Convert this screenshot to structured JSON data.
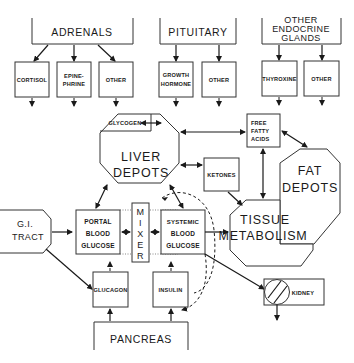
{
  "diagram": {
    "glands": {
      "adrenals": "ADRENALS",
      "pituitary": "PITUITARY",
      "other_endocrine_1": "OTHER",
      "other_endocrine_2": "ENDOCRINE",
      "other_endocrine_3": "GLANDS",
      "pancreas": "PANCREAS"
    },
    "hormones": {
      "cortisol": "CORTISOL",
      "epinephrine_1": "EPINE-",
      "epinephrine_2": "PHRINE",
      "adrenal_other": "OTHER",
      "growth_1": "GROWTH",
      "growth_2": "HORMONE",
      "pituitary_other": "OTHER",
      "thyroxine": "THYROXINE",
      "endocrine_other": "OTHER",
      "glucagon": "GLUCAGON",
      "insulin": "INSULIN"
    },
    "stores": {
      "glycogen": "GLYCOGEN",
      "liver_1": "LIVER",
      "liver_2": "DEPOTS",
      "ffa_1": "FREE",
      "ffa_2": "FATTY",
      "ffa_3": "ACIDS",
      "ketones": "KETONES",
      "fat_1": "FAT",
      "fat_2": "DEPOTS"
    },
    "flow": {
      "gi_1": "G.I.",
      "gi_2": "TRACT",
      "portal_1": "PORTAL",
      "portal_2": "BLOOD",
      "portal_3": "GLUCOSE",
      "mixer": [
        "M",
        "I",
        "X",
        "E",
        "R"
      ],
      "systemic_1": "SYSTEMIC",
      "systemic_2": "BLOOD",
      "systemic_3": "GLUCOSE",
      "tissue_1": "TISSUE",
      "tissue_2": "METABOLISM",
      "kidney": "KIDNEY"
    }
  }
}
